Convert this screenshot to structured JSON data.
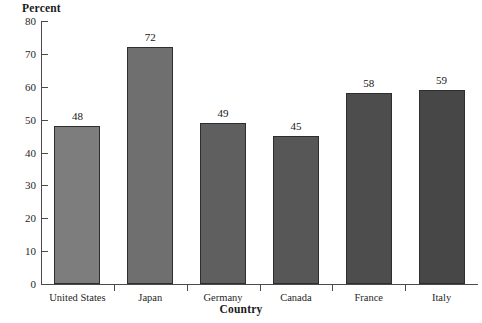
{
  "chart_data": {
    "type": "bar",
    "title": "",
    "xlabel": "Country",
    "ylabel": "Percent",
    "categories": [
      "United States",
      "Japan",
      "Germany",
      "Canada",
      "France",
      "Italy"
    ],
    "values": [
      48,
      72,
      49,
      45,
      58,
      59
    ],
    "value_labels": [
      "48",
      "72",
      "49",
      "45",
      "58",
      "59"
    ],
    "ylim": [
      0,
      80
    ],
    "ytick_step": 10,
    "yticks": [
      0,
      10,
      20,
      30,
      40,
      50,
      60,
      70,
      80
    ],
    "ytick_labels": [
      "0",
      "10",
      "20",
      "30",
      "40",
      "50",
      "60",
      "70",
      "80"
    ],
    "grid": false,
    "legend": false,
    "legend_position": "none",
    "tick_direction": "in",
    "bar_colors": [
      "#7d7d7d",
      "#6f6f6f",
      "#5f5f5f",
      "#575757",
      "#4d4d4d",
      "#474747"
    ],
    "bar_edge_color": "#2e2e2e",
    "axis_color": "#4a4a4a",
    "background_color": "#ffffff",
    "text_color": "#1a1a1a"
  }
}
